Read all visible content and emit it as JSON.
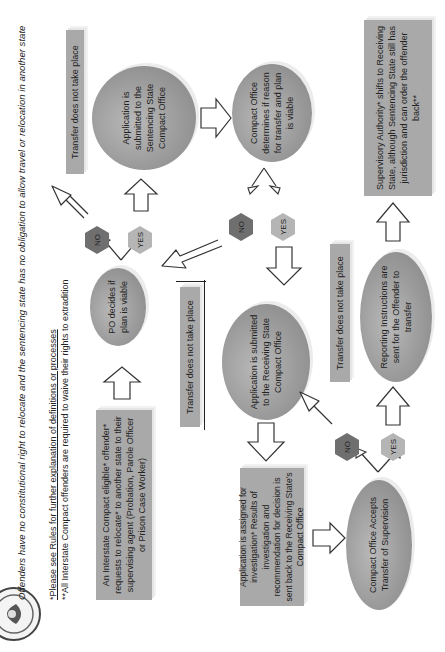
{
  "header": {
    "logo": "interstate-compact-seal",
    "disclaimer": "Offenders have no constitutional right to relocate and the sentencing state has no obligation to allow travel or relocation in another state",
    "footnote_1": "*Please see Rules for further explanation of definitions or processes",
    "footnote_2": "**All Interstate Compact offenders are required to waive their rights to extradition"
  },
  "flow": {
    "start": "An Interstate Compact eligible* offender* requests to relocate* to another state to their supervising agent (Probation, Parole Officer or Prison Case Worker)",
    "po_decision": "PO decides if plan is viable",
    "decision_1": {
      "no": "NO",
      "yes": "YES"
    },
    "outcome_no_1": "Transfer does not take place",
    "sentencing_submit": "Application is submitted to the Sentencing State Compact Office",
    "compact_determines": "Compact Office determines if reason for transfer and plan is viable",
    "decision_2": {
      "no": "NO",
      "yes": "YES"
    },
    "outcome_no_2": "Transfer does not take place",
    "receiving_submit": "Application is submitted to the Receiving State Compact Office",
    "investigation": "Application is assigned for investigation* Results of investigation and recommendation for decision is sent back to the Receiving State's Compact Office",
    "accepts": "Compact Office Accepts Transfer of Supervision",
    "decision_3": {
      "no": "NO",
      "yes": "YES"
    },
    "outcome_no_3": "Transfer does not take place",
    "reporting": "Reporting Instructions are sent for the Offender to transfer",
    "final": "Supervisory Authority* shifts to Receiving State, although Sentencing State still has jurisdiction and can order the offender back**"
  },
  "colors": {
    "box_fill": "#a9a9a9",
    "ellipse_fill": "#9a9a9a",
    "hex_no": "#6f6f6f",
    "hex_yes": "#b5b5b5",
    "text": "#222222"
  }
}
